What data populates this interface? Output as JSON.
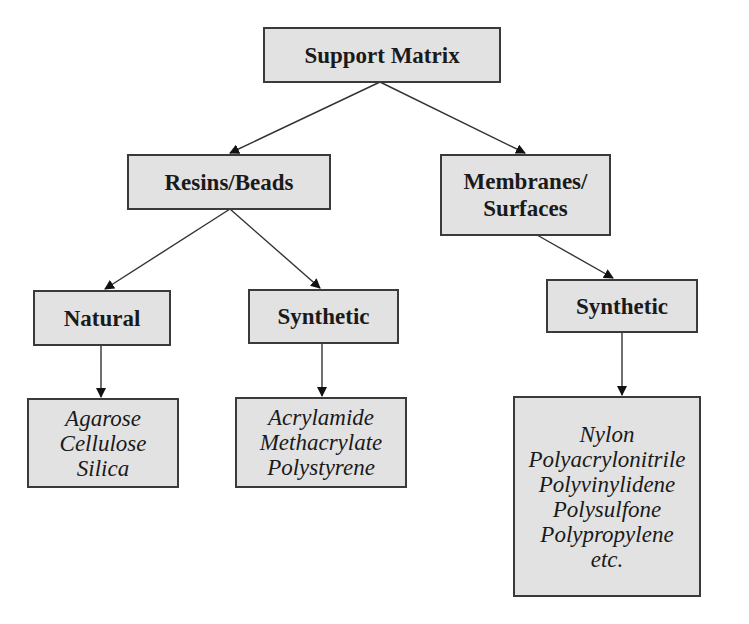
{
  "diagram": {
    "type": "tree",
    "colors": {
      "node_fill": "#e2e2e2",
      "border": "#3a3a3a",
      "text": "#1a1a1a",
      "edge": "#333333"
    },
    "root": {
      "label": "Support Matrix"
    },
    "level1": [
      {
        "label": "Resins/Beads"
      },
      {
        "lines": [
          "Membranes/",
          "Surfaces"
        ]
      }
    ],
    "level2": [
      {
        "label": "Natural",
        "parent": "Resins/Beads"
      },
      {
        "label": "Synthetic",
        "parent": "Resins/Beads"
      },
      {
        "label": "Synthetic",
        "parent": "Membranes/Surfaces"
      }
    ],
    "leaves": [
      {
        "parent": "Natural",
        "items": [
          "Agarose",
          "Cellulose",
          "Silica"
        ]
      },
      {
        "parent": "Synthetic (Resins/Beads)",
        "items": [
          "Acrylamide",
          "Methacrylate",
          "Polystyrene"
        ]
      },
      {
        "parent": "Synthetic (Membranes/Surfaces)",
        "items": [
          "Nylon",
          "Polyacrylonitrile",
          "Polyvinylidene",
          "Polysulfone",
          "Polypropylene",
          "etc."
        ]
      }
    ]
  }
}
